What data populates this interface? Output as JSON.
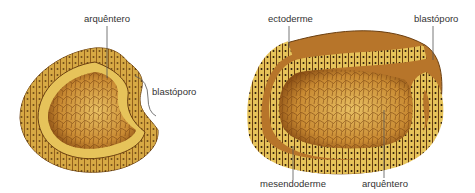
{
  "figure": {
    "left_embryo": {
      "labels": {
        "archenteron": "arquêntero",
        "blastopore": "blastóporo"
      }
    },
    "right_embryo": {
      "labels": {
        "ectoderm": "ectoderme",
        "blastopore": "blastóporo",
        "mesendoderm": "mesendoderme",
        "archenteron": "arquêntero"
      }
    },
    "colors": {
      "outer_cell": "#c58a2a",
      "yellow_cell": "#e9c85a",
      "interior": "#a8641c",
      "yolk": "#d9a347",
      "nucleus": "#2a1a0a",
      "leader": "#555555"
    }
  }
}
